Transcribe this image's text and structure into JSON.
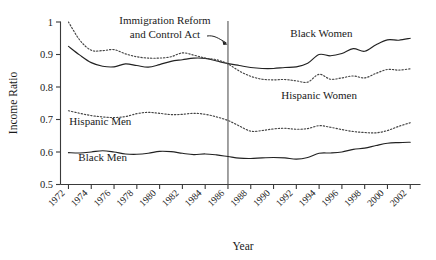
{
  "chart_data": {
    "type": "line",
    "title": "",
    "xlabel": "Year",
    "ylabel": "Income Ratio",
    "xlim": [
      1971.3,
      2002.9
    ],
    "ylim": [
      0.5,
      1.0
    ],
    "grid": false,
    "legend_position": "inline-labels",
    "x_ticks": [
      1972,
      1974,
      1976,
      1978,
      1980,
      1982,
      1984,
      1986,
      1988,
      1990,
      1992,
      1994,
      1996,
      1998,
      2000,
      2002
    ],
    "x_tick_labels": [
      "1972",
      "1974",
      "1976",
      "1978",
      "1980",
      "1982",
      "1984",
      "1986",
      "1988",
      "1990",
      "1992",
      "1994",
      "1996",
      "1998",
      "2000",
      "2002"
    ],
    "y_ticks": [
      0.5,
      0.6,
      0.7,
      0.8,
      0.9,
      1.0
    ],
    "y_tick_labels": [
      "0.5",
      "0.6",
      "0.7",
      "0.8",
      "0.9",
      "1"
    ],
    "annotations": [
      {
        "name": "immigration-reform-and-control-act",
        "text_line1": "Immigration Reform",
        "text_line2": "and Control Act",
        "x_value": 1986,
        "marker": "vertical-line",
        "arrow": true
      }
    ],
    "x": [
      1972,
      1973,
      1974,
      1975,
      1976,
      1977,
      1978,
      1979,
      1980,
      1981,
      1982,
      1983,
      1984,
      1985,
      1986,
      1987,
      1988,
      1989,
      1990,
      1991,
      1992,
      1993,
      1994,
      1995,
      1996,
      1997,
      1998,
      1999,
      2000,
      2001,
      2002
    ],
    "series": [
      {
        "name": "Black Women",
        "style": "solid",
        "color": "#222222",
        "label_x": 1994.2,
        "label_y": 0.955,
        "values": [
          0.925,
          0.898,
          0.875,
          0.864,
          0.862,
          0.871,
          0.866,
          0.861,
          0.869,
          0.879,
          0.884,
          0.889,
          0.888,
          0.88,
          0.872,
          0.866,
          0.86,
          0.857,
          0.857,
          0.86,
          0.862,
          0.873,
          0.9,
          0.896,
          0.903,
          0.918,
          0.91,
          0.93,
          0.945,
          0.944,
          0.95
        ]
      },
      {
        "name": "Hispanic Women",
        "style": "dotted",
        "color": "#444444",
        "label_x": 1994.0,
        "label_y": 0.762,
        "values": [
          1.0,
          0.944,
          0.913,
          0.912,
          0.915,
          0.902,
          0.893,
          0.889,
          0.889,
          0.893,
          0.905,
          0.898,
          0.889,
          0.884,
          0.871,
          0.849,
          0.833,
          0.824,
          0.822,
          0.823,
          0.819,
          0.815,
          0.839,
          0.824,
          0.828,
          0.834,
          0.828,
          0.842,
          0.854,
          0.852,
          0.856
        ]
      },
      {
        "name": "Hispanic Men",
        "style": "dotted",
        "color": "#444444",
        "label_x": 1974.8,
        "label_y": 0.684,
        "values": [
          0.727,
          0.719,
          0.712,
          0.708,
          0.706,
          0.709,
          0.718,
          0.722,
          0.719,
          0.715,
          0.716,
          0.719,
          0.716,
          0.708,
          0.697,
          0.68,
          0.664,
          0.666,
          0.671,
          0.673,
          0.67,
          0.672,
          0.681,
          0.676,
          0.669,
          0.663,
          0.66,
          0.659,
          0.666,
          0.679,
          0.69
        ]
      },
      {
        "name": "Black Men",
        "style": "solid",
        "color": "#222222",
        "label_x": 1975.0,
        "label_y": 0.573,
        "values": [
          0.598,
          0.597,
          0.6,
          0.604,
          0.6,
          0.594,
          0.593,
          0.596,
          0.602,
          0.601,
          0.596,
          0.592,
          0.594,
          0.591,
          0.586,
          0.581,
          0.58,
          0.582,
          0.583,
          0.582,
          0.578,
          0.583,
          0.596,
          0.597,
          0.6,
          0.608,
          0.612,
          0.62,
          0.627,
          0.629,
          0.63
        ]
      }
    ]
  }
}
